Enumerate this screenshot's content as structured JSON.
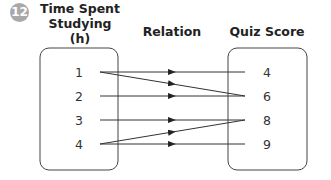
{
  "problem_number": "12",
  "headers": {
    "domain": "Time Spent Studying (h)",
    "domain_line1": "Time Spent",
    "domain_line2": "Studying (h)",
    "relation": "Relation",
    "range": "Quiz Score"
  },
  "domain_values": [
    "1",
    "2",
    "3",
    "4"
  ],
  "range_values": [
    "4",
    "6",
    "8",
    "9"
  ],
  "mappings": [
    {
      "from": "1",
      "to": "4"
    },
    {
      "from": "1",
      "to": "6"
    },
    {
      "from": "2",
      "to": "6"
    },
    {
      "from": "3",
      "to": "8"
    },
    {
      "from": "4",
      "to": "8"
    },
    {
      "from": "4",
      "to": "9"
    }
  ],
  "colors": {
    "badge": "#a9a9a9",
    "line": "#333333",
    "box": "#444444"
  }
}
